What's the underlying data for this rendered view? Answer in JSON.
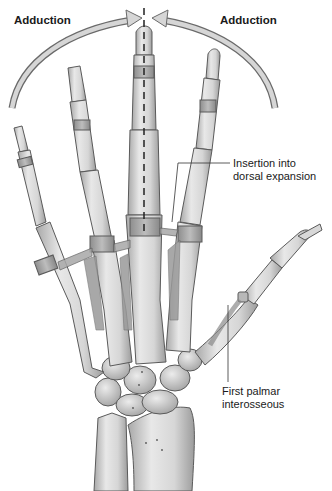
{
  "figure": {
    "labels": {
      "adduction_left": "Adduction",
      "adduction_right": "Adduction",
      "insertion": "Insertion into\ndorsal expansion",
      "insertion_line1": "Insertion into",
      "insertion_line2": "dorsal expansion",
      "first_palmar_line1": "First palmar",
      "first_palmar_line2": "interosseous"
    },
    "colors": {
      "bone_light": "#e4e4e4",
      "bone_mid": "#c4c4c4",
      "bone_dark": "#8a8a8a",
      "outline": "#5a5a5a",
      "muscle": "#9a9a9a",
      "arrow_fill": "#d6d6d6",
      "arrow_stroke": "#6a6a6a",
      "text": "#1a1a1a"
    }
  }
}
